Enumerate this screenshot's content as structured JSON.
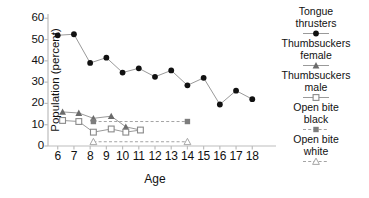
{
  "chart_data": {
    "type": "line",
    "title": "",
    "xlabel": "Age",
    "ylabel": "Population (percent)",
    "xlim": [
      5.4,
      18.6
    ],
    "ylim": [
      0,
      62
    ],
    "xticks": [
      6,
      7,
      8,
      9,
      10,
      11,
      12,
      13,
      14,
      15,
      16,
      17,
      18
    ],
    "yticks": [
      0,
      10,
      20,
      30,
      40,
      50,
      60
    ],
    "grid": false,
    "legend_position": "right",
    "series": [
      {
        "name": "Tongue thrusters",
        "label_lines": [
          "Tongue",
          "thrusters"
        ],
        "marker": "filled-circle",
        "linestyle": "solid",
        "color": "#111111",
        "x": [
          6,
          7,
          8,
          9,
          10,
          11,
          12,
          13,
          14,
          15,
          16,
          17,
          18
        ],
        "values": [
          52,
          52.5,
          39,
          41.5,
          34.5,
          36.5,
          32.5,
          35.5,
          28.5,
          32,
          19.5,
          26,
          22
        ]
      },
      {
        "name": "Thumbsuckers female",
        "label_lines": [
          "Thumbsuckers",
          "female"
        ],
        "marker": "filled-triangle",
        "linestyle": "solid",
        "color": "#6b6b6b",
        "x": [
          6.3,
          7.3,
          8.2,
          9.3,
          10.2,
          11.1
        ],
        "values": [
          16,
          15.5,
          13,
          14,
          9,
          7.5
        ]
      },
      {
        "name": "Thumbsuckers male",
        "label_lines": [
          "Thumbsuckers",
          "male"
        ],
        "marker": "open-square",
        "linestyle": "solid",
        "color": "#8a8a8a",
        "x": [
          6.3,
          7.3,
          8.2,
          9.3,
          10.2,
          11.1
        ],
        "values": [
          12,
          11.5,
          6.5,
          8,
          6.5,
          7.5
        ]
      },
      {
        "name": "Open bite black",
        "label_lines": [
          "Open bite",
          "black"
        ],
        "marker": "filled-square",
        "linestyle": "dashed",
        "color": "#7d7d7d",
        "x": [
          8.2,
          14
        ],
        "values": [
          11.5,
          11.5
        ]
      },
      {
        "name": "Open bite white",
        "label_lines": [
          "Open bite",
          "white"
        ],
        "marker": "open-triangle",
        "linestyle": "dashed",
        "color": "#a6a6a6",
        "x": [
          8.2,
          14
        ],
        "values": [
          2,
          2
        ]
      }
    ]
  }
}
